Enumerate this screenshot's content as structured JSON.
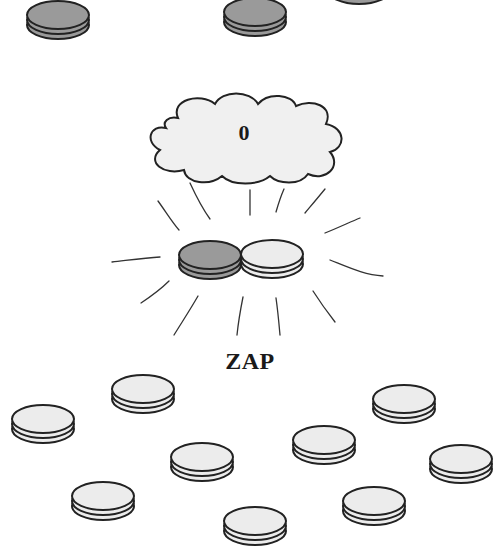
{
  "cloud": {
    "label": "0"
  },
  "caption": {
    "label": "ZAP"
  },
  "colors": {
    "dark_coin": "#9a9a9a",
    "light_coin": "#ececec",
    "outline": "#222222",
    "cloud_fill": "#f0f0f0"
  },
  "coins": {
    "top_row": [
      {
        "cx": 58,
        "cy": 15,
        "type": "dark"
      },
      {
        "cx": 255,
        "cy": 12,
        "type": "dark"
      },
      {
        "cx": 359,
        "cy": -20,
        "type": "dark"
      }
    ],
    "center_pair": [
      {
        "cx": 210,
        "cy": 255,
        "type": "dark"
      },
      {
        "cx": 272,
        "cy": 254,
        "type": "light"
      }
    ],
    "bottom_scatter": [
      {
        "cx": 43,
        "cy": 419,
        "type": "light"
      },
      {
        "cx": 143,
        "cy": 389,
        "type": "light"
      },
      {
        "cx": 202,
        "cy": 457,
        "type": "light"
      },
      {
        "cx": 103,
        "cy": 496,
        "type": "light"
      },
      {
        "cx": 255,
        "cy": 521,
        "type": "light"
      },
      {
        "cx": 324,
        "cy": 440,
        "type": "light"
      },
      {
        "cx": 404,
        "cy": 399,
        "type": "light"
      },
      {
        "cx": 461,
        "cy": 459,
        "type": "light"
      },
      {
        "cx": 374,
        "cy": 501,
        "type": "light"
      }
    ]
  }
}
